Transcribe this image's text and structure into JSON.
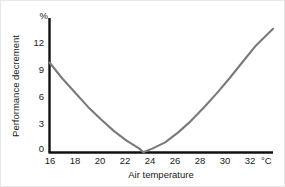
{
  "chart_data": {
    "type": "line",
    "title": "",
    "xlabel": "Air temperature",
    "ylabel": "Performance decrement",
    "x_unit": "°C",
    "y_unit": "%",
    "xlim": [
      16,
      33.4
    ],
    "ylim": [
      -1,
      14.5
    ],
    "xticks": [
      16,
      18,
      20,
      22,
      24,
      26,
      28,
      30,
      32
    ],
    "xtick_labels": [
      "16",
      "18",
      "20",
      "22",
      "24",
      "26",
      "28",
      "30",
      "32"
    ],
    "yticks": [
      0,
      3,
      6,
      9,
      12
    ],
    "ytick_labels": [
      "0",
      "3",
      "6",
      "9",
      "12"
    ],
    "grid": false,
    "legend": null,
    "series": [
      {
        "name": "Performance decrement",
        "color": "#7a7a7a",
        "x": [
          16,
          17,
          18,
          19,
          20,
          21,
          22,
          23,
          23.3,
          24,
          25,
          26,
          27,
          28,
          29,
          30,
          31,
          32,
          33.4
        ],
        "values": [
          9.8,
          8.0,
          6.4,
          4.8,
          3.4,
          2.1,
          1.0,
          0.1,
          -0.3,
          0.1,
          0.8,
          1.9,
          3.2,
          4.7,
          6.3,
          8.0,
          9.8,
          11.6,
          13.6
        ]
      }
    ],
    "annotations": []
  },
  "axes": {
    "y_unit_label": "%",
    "x_unit_label": "°C",
    "y_title": "Performance decrement",
    "x_title": "Air temperature",
    "y_tick_0": "0",
    "y_tick_1": "3",
    "y_tick_2": "6",
    "y_tick_3": "9",
    "y_tick_4": "12",
    "x_tick_0": "16",
    "x_tick_1": "18",
    "x_tick_2": "20",
    "x_tick_3": "22",
    "x_tick_4": "24",
    "x_tick_5": "26",
    "x_tick_6": "28",
    "x_tick_7": "30",
    "x_tick_8": "32"
  },
  "colors": {
    "curve": "#7a7a7a",
    "axis": "#111111",
    "text": "#1a1a1a",
    "background": "#ffffff"
  }
}
